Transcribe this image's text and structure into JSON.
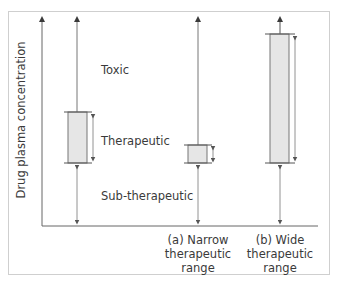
{
  "diagram": {
    "y_axis_label": "Drug plasma concentration",
    "zones": {
      "toxic": "Toxic",
      "therapeutic": "Therapeutic",
      "sub_therapeutic": "Sub-therapeutic"
    },
    "categories": [
      {
        "id": "a",
        "lines": [
          "(a) Narrow",
          "therapeutic",
          "range"
        ]
      },
      {
        "id": "b",
        "lines": [
          "(b) Wide",
          "therapeutic",
          "range"
        ]
      }
    ],
    "colors": {
      "line": "#555555",
      "axis": "#666666",
      "box_fill": "#e6e6e6",
      "frame": "#cfcfcf",
      "text": "#3a3a3a"
    }
  }
}
